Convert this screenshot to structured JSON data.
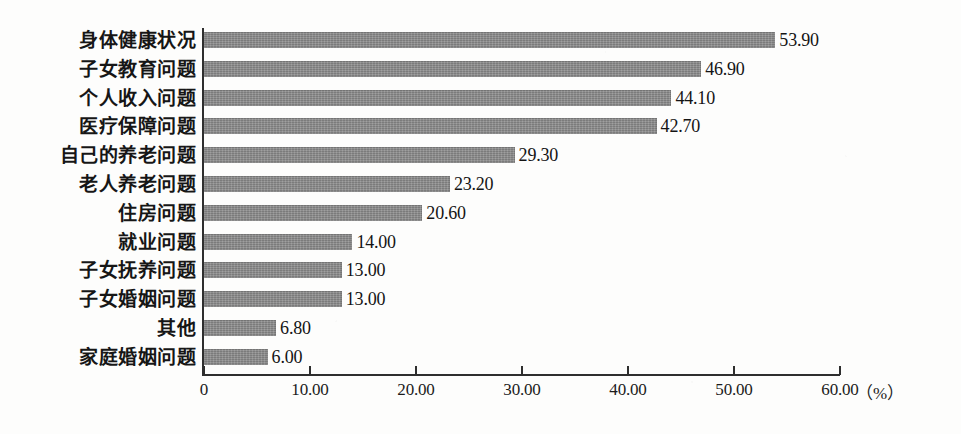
{
  "chart_data": {
    "type": "bar",
    "orientation": "horizontal",
    "title": "",
    "subtitle": "",
    "xlabel": "（%）",
    "ylabel": "",
    "xlim": [
      0,
      60
    ],
    "grid": false,
    "legend": null,
    "bar_color": "#8a8a8a",
    "axis_color": "#2e2e2e",
    "background_color": "#fdfdfc",
    "categories": [
      "身体健康状况",
      "子女教育问题",
      "个人收入问题",
      "医疗保障问题",
      "自己的养老问题",
      "老人养老问题",
      "住房问题",
      "就业问题",
      "子女抚养问题",
      "子女婚姻问题",
      "其他",
      "家庭婚姻问题"
    ],
    "values": [
      53.9,
      46.9,
      44.1,
      42.7,
      29.3,
      23.2,
      20.6,
      14.0,
      13.0,
      13.0,
      6.8,
      6.0
    ],
    "value_labels": [
      "53.90",
      "46.90",
      "44.10",
      "42.70",
      "29.30",
      "23.20",
      "20.60",
      "14.00",
      "13.00",
      "13.00",
      "6.80",
      "6.00"
    ],
    "xticks": [
      0,
      10,
      20,
      30,
      40,
      50,
      60
    ],
    "xtick_labels": [
      "0",
      "10.00",
      "20.00",
      "30.00",
      "40.00",
      "50.00",
      "60.00"
    ],
    "unit_label": "（%）"
  }
}
